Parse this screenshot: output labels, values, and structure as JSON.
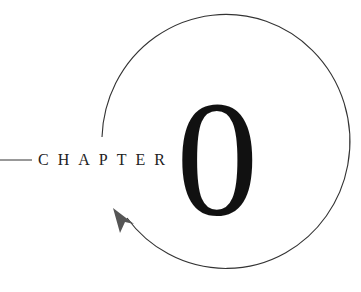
{
  "heading": {
    "word": "CHAPTER",
    "number": "0"
  },
  "colors": {
    "stroke": "#333333",
    "text": "#111111",
    "arrow": "#555555"
  },
  "icons": {
    "arrow": "circular-arrow-icon"
  }
}
